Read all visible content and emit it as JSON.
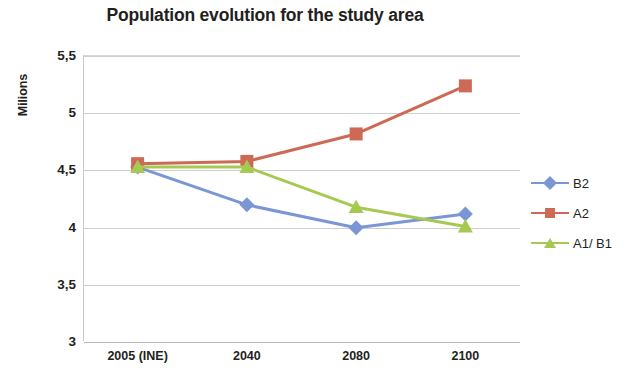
{
  "chart_data": {
    "type": "line",
    "title": "Population evolution for the study area",
    "xlabel": "",
    "ylabel": "Milions",
    "categories": [
      "2005 (INE)",
      "2040",
      "2080",
      "2100"
    ],
    "ylim": [
      3,
      5.5
    ],
    "y_ticks": [
      3,
      3.5,
      4,
      4.5,
      5,
      5.5
    ],
    "y_tick_labels": [
      "3",
      "3,5",
      "4",
      "4,5",
      "5",
      "5,5"
    ],
    "grid": true,
    "legend_position": "right",
    "series": [
      {
        "name": "B2",
        "color": "#7B96D4",
        "marker": "diamond",
        "values": [
          4.52,
          4.19,
          3.99,
          4.11
        ]
      },
      {
        "name": "A2",
        "color": "#CC6A55",
        "marker": "square",
        "values": [
          4.55,
          4.57,
          4.81,
          5.23
        ]
      },
      {
        "name": "A1/ B1",
        "color": "#A6C952",
        "marker": "triangle",
        "values": [
          4.52,
          4.52,
          4.17,
          4.0
        ]
      }
    ]
  },
  "legend": {
    "items": [
      {
        "label": "B2"
      },
      {
        "label": "A2"
      },
      {
        "label": "A1/ B1"
      }
    ]
  }
}
